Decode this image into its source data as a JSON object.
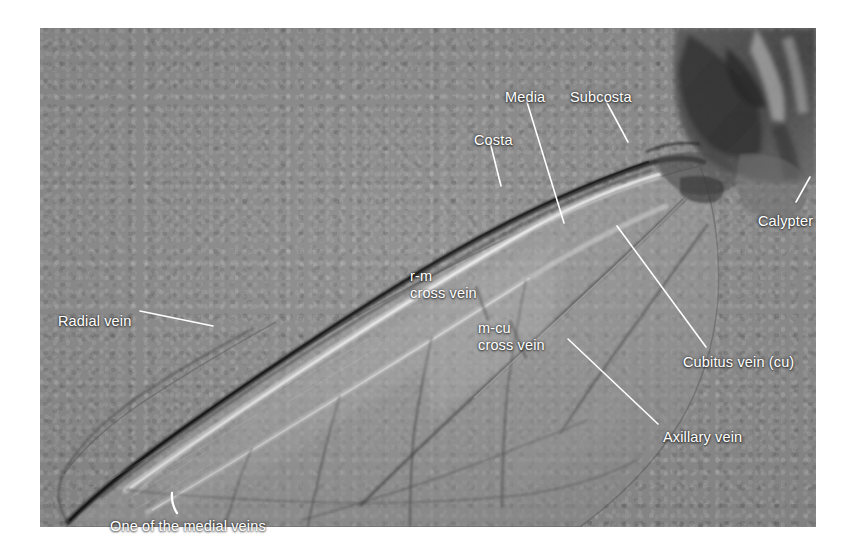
{
  "figure": {
    "type": "labeled anatomical photograph",
    "plate": {
      "left": 40,
      "top": 28,
      "width": 776,
      "height": 499,
      "background_color": "#8a8a8a"
    },
    "label_color": "#ffffff",
    "leader_color": "#ffffff"
  },
  "labels": [
    {
      "id": "costa",
      "text": "Costa",
      "x": 474,
      "y": 132,
      "anchor": "start"
    },
    {
      "id": "media",
      "text": "Media",
      "x": 505,
      "y": 89,
      "anchor": "start"
    },
    {
      "id": "subcosta",
      "text": "Subcosta",
      "x": 570,
      "y": 89,
      "anchor": "start"
    },
    {
      "id": "calypter",
      "text": "Calypter",
      "x": 758,
      "y": 213,
      "anchor": "start"
    },
    {
      "id": "cubitus",
      "text": "Cubitus vein (cu)",
      "x": 683,
      "y": 354,
      "anchor": "start"
    },
    {
      "id": "axillary",
      "text": "Axillary vein",
      "x": 663,
      "y": 429,
      "anchor": "start"
    },
    {
      "id": "radial",
      "text": "Radial vein",
      "x": 58,
      "y": 313,
      "anchor": "start"
    },
    {
      "id": "medial",
      "text": "One of the medial veins",
      "x": 110,
      "y": 518,
      "anchor": "start"
    },
    {
      "id": "rm",
      "text": "r-m\ncross vein",
      "x": 410,
      "y": 268,
      "anchor": "start"
    },
    {
      "id": "mcu",
      "text": "m-cu\ncross vein",
      "x": 478,
      "y": 320,
      "anchor": "start"
    }
  ],
  "leaders": [
    {
      "id": "costa-leader",
      "x1": 490,
      "y1": 142,
      "x2": 501,
      "y2": 186
    },
    {
      "id": "media-leader",
      "x1": 527,
      "y1": 102,
      "x2": 564,
      "y2": 223
    },
    {
      "id": "subcosta-leader",
      "x1": 606,
      "y1": 101,
      "x2": 628,
      "y2": 142
    },
    {
      "id": "calypter-leader",
      "x1": 796,
      "y1": 202,
      "x2": 810,
      "y2": 177
    },
    {
      "id": "cubitus-leader",
      "x1": 617,
      "y1": 226,
      "x2": 706,
      "y2": 347
    },
    {
      "id": "axillary-leader",
      "x1": 568,
      "y1": 339,
      "x2": 658,
      "y2": 424
    },
    {
      "id": "radial-leader",
      "x1": 140,
      "y1": 311,
      "x2": 213,
      "y2": 326
    },
    {
      "id": "medial-leader",
      "x1": 178,
      "y1": 512,
      "x2": 173,
      "y2": 494
    }
  ],
  "anatomy_parts": [
    "Costa",
    "Subcosta",
    "Media",
    "Radial vein",
    "Cubitus vein (cu)",
    "Axillary vein",
    "One of the medial veins",
    "r-m cross vein",
    "m-cu cross vein",
    "Calypter"
  ]
}
